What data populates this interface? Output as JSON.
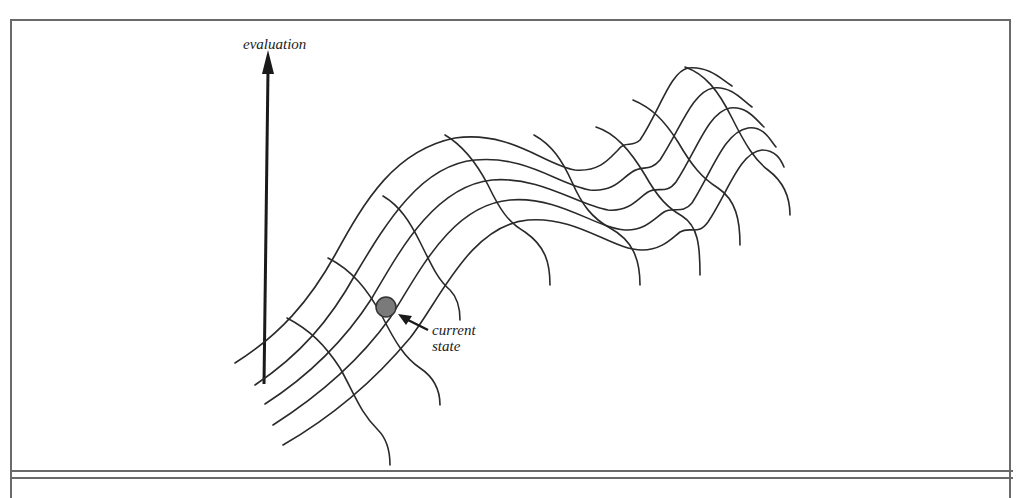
{
  "diagram": {
    "axis_label": "evaluation",
    "marker_label_line1": "current",
    "marker_label_line2": "state",
    "colors": {
      "line": "#2a2a2a",
      "frame": "#6a6a6a",
      "marker_fill": "#7a7a7a",
      "marker_stroke": "#333333"
    },
    "ridge_curve_count": 5,
    "cross_curve_count": 8
  }
}
